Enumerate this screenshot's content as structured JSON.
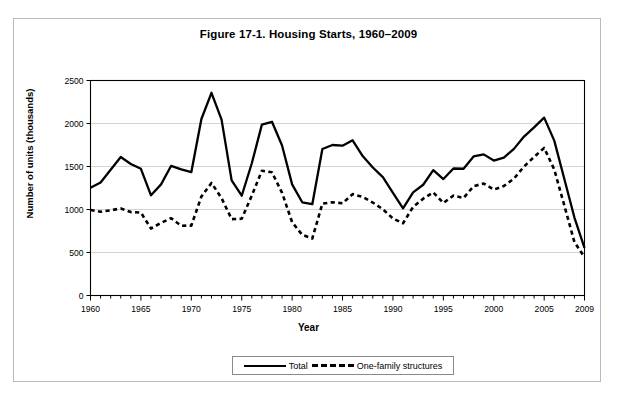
{
  "figure": {
    "title": "Figure 17-1. Housing Starts, 1960–2009",
    "y_axis_label": "Number of units (thousands)",
    "x_axis_label": "Year"
  },
  "legend": {
    "position": "bottom-center",
    "entries": [
      {
        "label": "Total",
        "style": "solid",
        "color": "#000000"
      },
      {
        "label": "One-family structures",
        "style": "dashed",
        "color": "#000000"
      }
    ]
  },
  "chart_data": {
    "type": "line",
    "title": "Figure 17-1. Housing Starts, 1960–2009",
    "xlabel": "Year",
    "ylabel": "Number of units (thousands)",
    "xlim": [
      1960,
      2009
    ],
    "ylim": [
      0,
      2500
    ],
    "ytick_values": [
      0,
      500,
      1000,
      1500,
      2000,
      2500
    ],
    "ytick_labels": [
      "0",
      "500",
      "1000",
      "1500",
      "2000",
      "2500"
    ],
    "xtick_values": [
      1960,
      1965,
      1970,
      1975,
      1980,
      1985,
      1990,
      1995,
      2000,
      2005,
      2009
    ],
    "xtick_labels": [
      "1960",
      "1965",
      "1970",
      "1975",
      "1980",
      "1985",
      "1990",
      "1995",
      "2000",
      "2005",
      "2009"
    ],
    "minor_xticks": "every 1 year",
    "grid": "horizontal",
    "x": [
      1960,
      1961,
      1962,
      1963,
      1964,
      1965,
      1966,
      1967,
      1968,
      1969,
      1970,
      1971,
      1972,
      1973,
      1974,
      1975,
      1976,
      1977,
      1978,
      1979,
      1980,
      1981,
      1982,
      1983,
      1984,
      1985,
      1986,
      1987,
      1988,
      1989,
      1990,
      1991,
      1992,
      1993,
      1994,
      1995,
      1996,
      1997,
      1998,
      1999,
      2000,
      2001,
      2002,
      2003,
      2004,
      2005,
      2006,
      2007,
      2008,
      2009
    ],
    "series": [
      {
        "name": "Total",
        "style": "solid",
        "color": "#000000",
        "values": [
          1252,
          1313,
          1463,
          1610,
          1529,
          1473,
          1165,
          1292,
          1508,
          1467,
          1434,
          2052,
          2357,
          2045,
          1338,
          1160,
          1538,
          1987,
          2020,
          1745,
          1292,
          1084,
          1062,
          1703,
          1750,
          1742,
          1805,
          1621,
          1488,
          1376,
          1193,
          1014,
          1200,
          1288,
          1457,
          1354,
          1477,
          1474,
          1617,
          1641,
          1569,
          1603,
          1705,
          1848,
          1956,
          2068,
          1801,
          1355,
          906,
          554
        ]
      },
      {
        "name": "One-family structures",
        "style": "dashed",
        "color": "#000000",
        "values": [
          995,
          974,
          991,
          1012,
          970,
          964,
          779,
          844,
          899,
          811,
          813,
          1151,
          1309,
          1132,
          888,
          892,
          1162,
          1451,
          1433,
          1194,
          852,
          705,
          663,
          1068,
          1084,
          1072,
          1179,
          1146,
          1081,
          1003,
          895,
          840,
          1030,
          1126,
          1198,
          1076,
          1161,
          1134,
          1271,
          1302,
          1231,
          1273,
          1359,
          1499,
          1611,
          1716,
          1465,
          1046,
          622,
          445
        ]
      }
    ]
  }
}
